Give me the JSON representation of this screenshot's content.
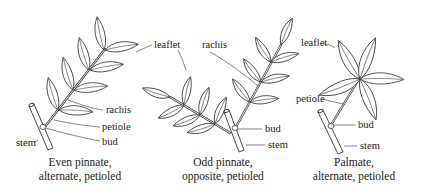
{
  "figure": {
    "panels": [
      {
        "id": "even-pinnate",
        "caption_line1": "Even pinnate,",
        "caption_line2": "alternate, petioled",
        "labels": {
          "rachis": "rachis",
          "petiole": "petiole",
          "bud": "bud",
          "stem": "stem"
        }
      },
      {
        "id": "odd-pinnate",
        "caption_line1": "Odd pinnate,",
        "caption_line2": "opposite, petioled",
        "labels": {
          "leaflet": "leaflet",
          "rachis": "rachis",
          "bud": "bud",
          "stem": "stem"
        }
      },
      {
        "id": "palmate",
        "caption_line1": "Palmate,",
        "caption_line2": "alternate, petioled",
        "labels": {
          "leaflet": "leaflet",
          "petiole": "petiole",
          "bud": "bud",
          "stem": "stem"
        }
      }
    ]
  }
}
